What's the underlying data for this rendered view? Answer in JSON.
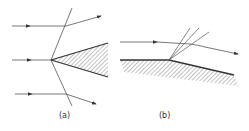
{
  "figure": {
    "panels": [
      {
        "id": "a",
        "label": "(a)",
        "description": "Oblique shock waves attached to a wedge; streamlines deflect at shock"
      },
      {
        "id": "b",
        "label": "(b)",
        "description": "Expansion fan at a convex corner; streamline turns through fan"
      }
    ],
    "colors": {
      "line": "#444444",
      "hatch": "#777777",
      "background": "#ffffff"
    }
  }
}
